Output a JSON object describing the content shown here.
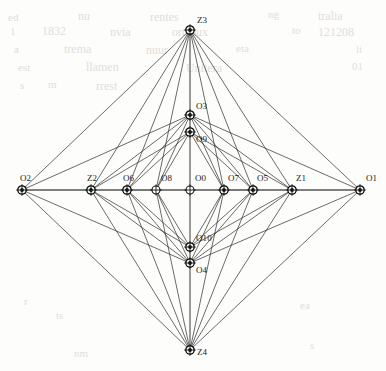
{
  "figure": {
    "width": 386,
    "height": 371,
    "background_color": "#fdfdfc",
    "edge_color": "#2b2b2b",
    "node_stroke_color": "#111111",
    "label_color": "#1a1a1a"
  },
  "nodes": [
    {
      "id": "O2",
      "label": "O2",
      "x": 22,
      "y": 190,
      "kind": "hub",
      "label_dx": -2,
      "label_dy": -16,
      "label_align": "left"
    },
    {
      "id": "Z2",
      "label": "Z2",
      "x": 91,
      "y": 190,
      "kind": "hub",
      "label_dx": -4,
      "label_dy": -16,
      "label_align": "left"
    },
    {
      "id": "O6",
      "label": "O6",
      "x": 127,
      "y": 190,
      "kind": "hub",
      "label_dx": -4,
      "label_dy": -16,
      "label_align": "left"
    },
    {
      "id": "O8",
      "label": "O8",
      "x": 156,
      "y": 190,
      "kind": "plain",
      "label_dx": 5,
      "label_dy": -16,
      "label_align": "left"
    },
    {
      "id": "O0",
      "label": "O0",
      "x": 190,
      "y": 190,
      "kind": "plain",
      "label_dx": 5,
      "label_dy": -16,
      "label_align": "left"
    },
    {
      "id": "O7",
      "label": "O7",
      "x": 224,
      "y": 190,
      "kind": "hub",
      "label_dx": 4,
      "label_dy": -16,
      "label_align": "left"
    },
    {
      "id": "O5",
      "label": "O5",
      "x": 253,
      "y": 190,
      "kind": "hub",
      "label_dx": 4,
      "label_dy": -16,
      "label_align": "left"
    },
    {
      "id": "Z1",
      "label": "Z1",
      "x": 292,
      "y": 190,
      "kind": "hub",
      "label_dx": 4,
      "label_dy": -16,
      "label_align": "left"
    },
    {
      "id": "O1",
      "label": "O1",
      "x": 360,
      "y": 190,
      "kind": "hub",
      "label_dx": 6,
      "label_dy": -16,
      "label_align": "left"
    },
    {
      "id": "Z3",
      "label": "Z3",
      "x": 190,
      "y": 30,
      "kind": "hub",
      "label_dx": 7,
      "label_dy": -14,
      "label_align": "left"
    },
    {
      "id": "O3",
      "label": "O3",
      "x": 190,
      "y": 115,
      "kind": "hub",
      "label_dx": 6,
      "label_dy": -13,
      "label_align": "left"
    },
    {
      "id": "O9",
      "label": "O9",
      "x": 190,
      "y": 132,
      "kind": "hub",
      "label_dx": 6,
      "label_dy": 3,
      "label_align": "left"
    },
    {
      "id": "O10",
      "label": "O10",
      "x": 190,
      "y": 247,
      "kind": "hub",
      "label_dx": 6,
      "label_dy": -13,
      "label_align": "left"
    },
    {
      "id": "O4",
      "label": "O4",
      "x": 190,
      "y": 263,
      "kind": "hub",
      "label_dx": 6,
      "label_dy": 3,
      "label_align": "left"
    },
    {
      "id": "Z4",
      "label": "Z4",
      "x": 190,
      "y": 350,
      "kind": "hub",
      "label_dx": 7,
      "label_dy": -2,
      "label_align": "left"
    }
  ],
  "axis_edges": [
    [
      "O2",
      "Z2"
    ],
    [
      "Z2",
      "O6"
    ],
    [
      "O6",
      "O8"
    ],
    [
      "O8",
      "O0"
    ],
    [
      "O0",
      "O7"
    ],
    [
      "O7",
      "O5"
    ],
    [
      "O5",
      "Z1"
    ],
    [
      "Z1",
      "O1"
    ],
    [
      "Z3",
      "O3"
    ],
    [
      "O3",
      "O9"
    ],
    [
      "O9",
      "O0"
    ],
    [
      "O0",
      "O10"
    ],
    [
      "O10",
      "O4"
    ],
    [
      "O4",
      "Z4"
    ]
  ],
  "edges": [
    [
      "Z3",
      "O2"
    ],
    [
      "Z3",
      "Z2"
    ],
    [
      "Z3",
      "O6"
    ],
    [
      "Z3",
      "O8"
    ],
    [
      "Z3",
      "O7"
    ],
    [
      "Z3",
      "O5"
    ],
    [
      "Z3",
      "Z1"
    ],
    [
      "Z3",
      "O1"
    ],
    [
      "Z4",
      "O2"
    ],
    [
      "Z4",
      "Z2"
    ],
    [
      "Z4",
      "O6"
    ],
    [
      "Z4",
      "O8"
    ],
    [
      "Z4",
      "O7"
    ],
    [
      "Z4",
      "O5"
    ],
    [
      "Z4",
      "Z1"
    ],
    [
      "Z4",
      "O1"
    ],
    [
      "O3",
      "O2"
    ],
    [
      "O3",
      "Z2"
    ],
    [
      "O3",
      "O6"
    ],
    [
      "O3",
      "O8"
    ],
    [
      "O3",
      "O7"
    ],
    [
      "O3",
      "O5"
    ],
    [
      "O3",
      "Z1"
    ],
    [
      "O3",
      "O1"
    ],
    [
      "O9",
      "Z2"
    ],
    [
      "O9",
      "O6"
    ],
    [
      "O9",
      "O8"
    ],
    [
      "O9",
      "O7"
    ],
    [
      "O9",
      "O5"
    ],
    [
      "O9",
      "Z1"
    ],
    [
      "O4",
      "O2"
    ],
    [
      "O4",
      "Z2"
    ],
    [
      "O4",
      "O6"
    ],
    [
      "O4",
      "O8"
    ],
    [
      "O4",
      "O7"
    ],
    [
      "O4",
      "O5"
    ],
    [
      "O4",
      "Z1"
    ],
    [
      "O4",
      "O1"
    ],
    [
      "O10",
      "Z2"
    ],
    [
      "O10",
      "O6"
    ],
    [
      "O10",
      "O8"
    ],
    [
      "O10",
      "O7"
    ],
    [
      "O10",
      "O5"
    ],
    [
      "O10",
      "Z1"
    ],
    [
      "O2",
      "O1"
    ]
  ],
  "background_bleed": [
    {
      "text": "ed",
      "x": 8,
      "y": 12,
      "size": 11
    },
    {
      "text": "nu",
      "x": 78,
      "y": 10,
      "size": 12
    },
    {
      "text": "rentes",
      "x": 150,
      "y": 11,
      "size": 12
    },
    {
      "text": "ng",
      "x": 268,
      "y": 9,
      "size": 11
    },
    {
      "text": "tralia",
      "x": 318,
      "y": 10,
      "size": 12
    },
    {
      "text": "1",
      "x": 10,
      "y": 26,
      "size": 11
    },
    {
      "text": "1832",
      "x": 42,
      "y": 25,
      "size": 12
    },
    {
      "text": "nvia",
      "x": 110,
      "y": 26,
      "size": 12
    },
    {
      "text": "orteaux",
      "x": 172,
      "y": 26,
      "size": 12
    },
    {
      "text": "to",
      "x": 292,
      "y": 25,
      "size": 11
    },
    {
      "text": "121208",
      "x": 318,
      "y": 26,
      "size": 12
    },
    {
      "text": "a",
      "x": 14,
      "y": 44,
      "size": 11
    },
    {
      "text": "trema",
      "x": 64,
      "y": 43,
      "size": 12
    },
    {
      "text": "nuur",
      "x": 146,
      "y": 44,
      "size": 12
    },
    {
      "text": "eta",
      "x": 236,
      "y": 43,
      "size": 11
    },
    {
      "text": "li",
      "x": 356,
      "y": 44,
      "size": 11
    },
    {
      "text": "est",
      "x": 18,
      "y": 62,
      "size": 11
    },
    {
      "text": "llamen",
      "x": 86,
      "y": 61,
      "size": 12
    },
    {
      "text": "Unitera",
      "x": 186,
      "y": 62,
      "size": 12
    },
    {
      "text": "01",
      "x": 352,
      "y": 61,
      "size": 11
    },
    {
      "text": "s",
      "x": 20,
      "y": 80,
      "size": 11
    },
    {
      "text": "m",
      "x": 48,
      "y": 79,
      "size": 11
    },
    {
      "text": "rrest",
      "x": 96,
      "y": 80,
      "size": 12
    },
    {
      "text": "r",
      "x": 24,
      "y": 296,
      "size": 11
    },
    {
      "text": "ts",
      "x": 56,
      "y": 310,
      "size": 11
    },
    {
      "text": "ea",
      "x": 300,
      "y": 300,
      "size": 11
    },
    {
      "text": "nm",
      "x": 74,
      "y": 348,
      "size": 11
    },
    {
      "text": "s",
      "x": 310,
      "y": 340,
      "size": 11
    }
  ]
}
